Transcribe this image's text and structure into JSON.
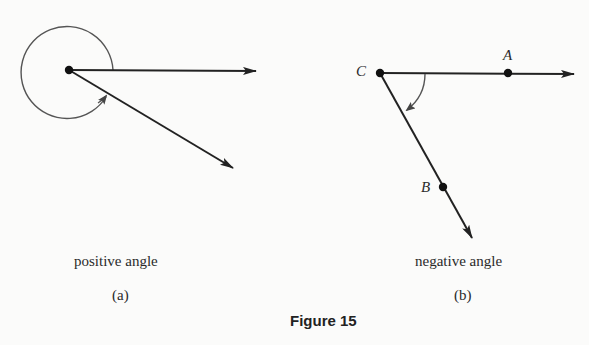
{
  "figure": {
    "title": "Figure 15",
    "panels": [
      {
        "id": "a",
        "label": "(a)",
        "caption": "positive angle",
        "vertex": [
          69,
          70
        ],
        "initial_ray_end": [
          256,
          71
        ],
        "terminal_ray_end": [
          233,
          168
        ],
        "rotation": "counterclockwise, nearly full turn"
      },
      {
        "id": "b",
        "label": "(b)",
        "caption": "negative angle",
        "points": {
          "C": "C",
          "A": "A",
          "B": "B"
        },
        "vertex": [
          380,
          73
        ],
        "initial_ray_end": [
          574,
          74
        ],
        "terminal_ray_end": [
          472,
          238
        ],
        "rotation": "clockwise"
      }
    ]
  }
}
